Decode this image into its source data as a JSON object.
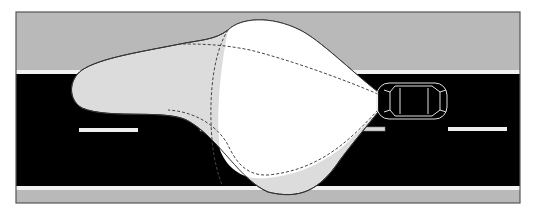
{
  "diagram": {
    "colors": {
      "background": "#ffffff",
      "shoulder": "#b9b9b9",
      "road": "#000000",
      "edge_line": "#f2f2f2",
      "frame": "#555555",
      "beam_outer": "#dcdcdc",
      "beam_inner": "#ffffff",
      "beam_outline": "#333333",
      "dashed_outline": "#444444",
      "car_outline": "#e0e0e0"
    },
    "elements": [
      "road-frame",
      "upper-shoulder",
      "lower-shoulder",
      "road-surface",
      "edge-lines",
      "lane-dashes",
      "high-beam-pattern",
      "low-beam-pattern",
      "dashed-beam-contours",
      "car-top-view"
    ]
  }
}
